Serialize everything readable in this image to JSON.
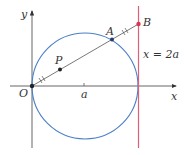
{
  "diagram": {
    "axes": {
      "x_label": "x",
      "y_label": "y",
      "origin_label": "O",
      "tick_label": "a"
    },
    "points": {
      "P": {
        "label": "P"
      },
      "A": {
        "label": "A"
      },
      "B": {
        "label": "B"
      }
    },
    "line": {
      "label": "x = 2a",
      "color": "#e0607a"
    },
    "circle": {
      "color": "#4a7fc8"
    },
    "colors": {
      "axis": "#555555",
      "segment": "#555555",
      "point": "#222222",
      "B_point": "#d9374f"
    }
  }
}
